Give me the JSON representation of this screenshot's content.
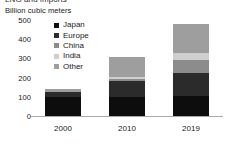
{
  "clipped_title": "LNG and imports",
  "axis_title": "Billion cubic meters",
  "legend": {
    "items": [
      {
        "label": "Japan",
        "color": "#0d0d0d"
      },
      {
        "label": "Europe",
        "color": "#2b2b2b"
      },
      {
        "label": "China",
        "color": "#8c8c8c"
      },
      {
        "label": "India",
        "color": "#cfcfcf"
      },
      {
        "label": "Other",
        "color": "#9e9e9e"
      }
    ]
  },
  "chart_data": {
    "type": "bar",
    "stacked": true,
    "title": "",
    "xlabel": "",
    "ylabel": "Billion cubic meters",
    "categories": [
      "2000",
      "2010",
      "2019"
    ],
    "yticks": [
      0,
      100,
      200,
      300,
      400,
      500
    ],
    "ylim": [
      0,
      500
    ],
    "grid": false,
    "legend_position": "inside-top-left",
    "series": [
      {
        "name": "Japan",
        "color": "#0d0d0d",
        "values": [
          100,
          100,
          105
        ]
      },
      {
        "name": "Europe",
        "color": "#2b2b2b",
        "values": [
          25,
          85,
          118
        ]
      },
      {
        "name": "China",
        "color": "#8c8c8c",
        "values": [
          0,
          10,
          70
        ]
      },
      {
        "name": "India",
        "color": "#cfcfcf",
        "values": [
          0,
          8,
          35
        ]
      },
      {
        "name": "Other",
        "color": "#9e9e9e",
        "values": [
          17,
          102,
          152
        ]
      }
    ],
    "totals": [
      142,
      305,
      480
    ]
  }
}
